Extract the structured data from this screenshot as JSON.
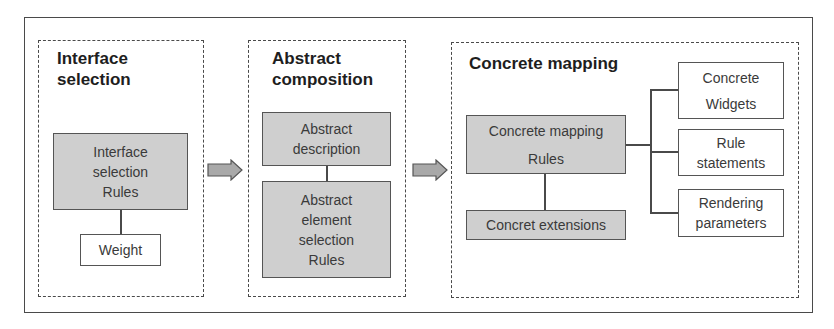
{
  "diagram": {
    "stages": [
      {
        "title": "Interface selection",
        "title_lines": [
          "Interface",
          "selection"
        ],
        "boxes": [
          {
            "lines": [
              "Interface",
              "selection",
              "Rules"
            ],
            "fill": "gray"
          },
          {
            "lines": [
              "Weight"
            ],
            "fill": "white"
          }
        ]
      },
      {
        "title": "Abstract composition",
        "title_lines": [
          "Abstract",
          "composition"
        ],
        "boxes": [
          {
            "lines": [
              "Abstract",
              "description"
            ],
            "fill": "gray"
          },
          {
            "lines": [
              "Abstract",
              "element",
              "selection",
              "Rules"
            ],
            "fill": "gray"
          }
        ]
      },
      {
        "title": "Concrete mapping",
        "title_lines": [
          "Concrete mapping"
        ],
        "boxes": [
          {
            "lines": [
              "Concrete mapping",
              "Rules"
            ],
            "fill": "gray"
          },
          {
            "lines": [
              "Concret extensions"
            ],
            "fill": "gray"
          },
          {
            "lines": [
              "Concrete",
              "Widgets"
            ],
            "fill": "white"
          },
          {
            "lines": [
              "Rule",
              "statements"
            ],
            "fill": "white"
          },
          {
            "lines": [
              "Rendering",
              "parameters"
            ],
            "fill": "white"
          }
        ]
      }
    ],
    "colors": {
      "box_gray": "#cfcfcf",
      "arrow_fill": "#a9a9a9",
      "stroke": "#4a4a4a"
    }
  }
}
